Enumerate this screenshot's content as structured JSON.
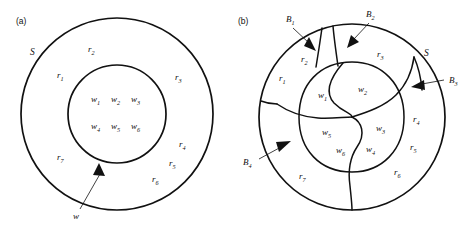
{
  "figure": {
    "background_color": "#ffffff",
    "line_color": "#111111",
    "panels": [
      {
        "id": "a",
        "caption": "(a)",
        "description": "Two concentric circles: outer set S containing an inner circle w; annulus subdivided conceptually into regions r1..r7; inner circle holds w1..w6",
        "set_label": "S",
        "inner_label": "w",
        "outer_circle": {
          "cx": 117,
          "cy": 114,
          "r": 96
        },
        "inner_circle": {
          "cx": 117,
          "cy": 114,
          "r": 49
        },
        "region_labels": [
          {
            "text": "r",
            "sub": "1",
            "x": 57,
            "y": 78
          },
          {
            "text": "r",
            "sub": "2",
            "x": 88,
            "y": 52
          },
          {
            "text": "r",
            "sub": "3",
            "x": 175,
            "y": 80
          },
          {
            "text": "r",
            "sub": "4",
            "x": 179,
            "y": 147
          },
          {
            "text": "r",
            "sub": "5",
            "x": 169,
            "y": 166
          },
          {
            "text": "r",
            "sub": "6",
            "x": 152,
            "y": 182
          },
          {
            "text": "r",
            "sub": "7",
            "x": 57,
            "y": 160
          }
        ],
        "w_labels": [
          {
            "text": "w",
            "sub": "1",
            "x": 91,
            "y": 102
          },
          {
            "text": "w",
            "sub": "2",
            "x": 111,
            "y": 102
          },
          {
            "text": "w",
            "sub": "3",
            "x": 131,
            "y": 102
          },
          {
            "text": "w",
            "sub": "4",
            "x": 91,
            "y": 129
          },
          {
            "text": "w",
            "sub": "5",
            "x": 111,
            "y": 129
          },
          {
            "text": "w",
            "sub": "6",
            "x": 131,
            "y": 129
          }
        ],
        "set_label_pos": {
          "x": 30,
          "y": 55
        },
        "callout": {
          "label": "w",
          "label_pos": {
            "x": 73,
            "y": 218
          },
          "line_from": {
            "x": 80,
            "y": 209
          },
          "line_to": {
            "x": 99,
            "y": 172
          }
        }
      },
      {
        "id": "b",
        "caption": "(b)",
        "description": "Single outer circle S partitioned by curved boundaries into regions r1..r7 and an inner lobed area split into w1..w6; four boundary callouts B1..B4",
        "set_label": "S",
        "outer_circle": {
          "cx": 352,
          "cy": 117,
          "r": 93
        },
        "region_labels": [
          {
            "text": "r",
            "sub": "1",
            "x": 279,
            "y": 81
          },
          {
            "text": "r",
            "sub": "2",
            "x": 301,
            "y": 62
          },
          {
            "text": "r",
            "sub": "3",
            "x": 377,
            "y": 57
          },
          {
            "text": "r",
            "sub": "4",
            "x": 413,
            "y": 122
          },
          {
            "text": "r",
            "sub": "5",
            "x": 410,
            "y": 150
          },
          {
            "text": "r",
            "sub": "6",
            "x": 394,
            "y": 175
          },
          {
            "text": "r",
            "sub": "7",
            "x": 299,
            "y": 179
          }
        ],
        "w_labels": [
          {
            "text": "w",
            "sub": "1",
            "x": 318,
            "y": 98
          },
          {
            "text": "w",
            "sub": "2",
            "x": 358,
            "y": 92
          },
          {
            "text": "w",
            "sub": "3",
            "x": 376,
            "y": 131
          },
          {
            "text": "w",
            "sub": "4",
            "x": 366,
            "y": 152
          },
          {
            "text": "w",
            "sub": "5",
            "x": 322,
            "y": 135
          },
          {
            "text": "w",
            "sub": "6",
            "x": 336,
            "y": 153
          }
        ],
        "set_label_pos": {
          "x": 424,
          "y": 55
        },
        "boundary_callouts": [
          {
            "label": "B",
            "sub": "1",
            "label_pos": {
              "x": 286,
              "y": 22
            },
            "line_from": {
              "x": 292,
              "y": 27
            },
            "line_to": {
              "x": 310,
              "y": 44
            }
          },
          {
            "label": "B",
            "sub": "2",
            "label_pos": {
              "x": 368,
              "y": 17
            },
            "line_from": {
              "x": 368,
              "y": 22
            },
            "line_to": {
              "x": 352,
              "y": 41
            }
          },
          {
            "label": "B",
            "sub": "3",
            "label_pos": {
              "x": 449,
              "y": 80
            },
            "line_from": {
              "x": 444,
              "y": 80
            },
            "line_to": {
              "x": 417,
              "y": 86
            }
          },
          {
            "label": "B",
            "sub": "4",
            "label_pos": {
              "x": 245,
              "y": 162
            },
            "line_from": {
              "x": 258,
              "y": 159
            },
            "line_to": {
              "x": 279,
              "y": 145
            }
          }
        ]
      }
    ]
  }
}
